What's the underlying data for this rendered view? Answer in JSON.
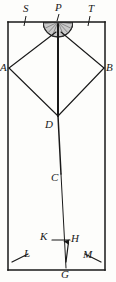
{
  "figure": {
    "kind": "geometry-diagram",
    "caption": "",
    "ink_color": "#191919",
    "background_color": "#fdfdfb",
    "hatch_color": "#8c8c8c",
    "frame": {
      "name": "outer-rectangle",
      "left": 8,
      "top": 22,
      "right": 105,
      "bottom": 270
    },
    "points": {
      "S": {
        "label": "S",
        "x": 22,
        "y": 22,
        "label_x": 24,
        "label_y": 5
      },
      "P": {
        "label": "P",
        "x": 58,
        "y": 22,
        "label_x": 57,
        "label_y": 4
      },
      "T": {
        "label": "T",
        "x": 92,
        "y": 22,
        "label_x": 90,
        "label_y": 5
      },
      "A": {
        "label": "A",
        "x": 9,
        "y": 68,
        "label_x": 1,
        "label_y": 62
      },
      "B": {
        "label": "B",
        "x": 104,
        "y": 68,
        "label_x": 106,
        "label_y": 62
      },
      "D": {
        "label": "D",
        "x": 58,
        "y": 116,
        "label_x": 46,
        "label_y": 116
      },
      "C": {
        "label": "C",
        "x": 61,
        "y": 174,
        "label_x": 53,
        "label_y": 172
      },
      "K": {
        "label": "K",
        "x": 52,
        "y": 240,
        "label_x": 41,
        "label_y": 234
      },
      "H": {
        "label": "H",
        "x": 69,
        "y": 240,
        "label_x": 72,
        "label_y": 235
      },
      "L": {
        "label": "L",
        "x": 22,
        "y": 258,
        "label_x": 25,
        "label_y": 250
      },
      "M": {
        "label": "M",
        "x": 88,
        "y": 258,
        "label_x": 85,
        "label_y": 251
      },
      "G": {
        "label": "G",
        "x": 66,
        "y": 270,
        "label_x": 62,
        "label_y": 270
      }
    },
    "semicircle": {
      "name": "hatched-semicircle-at-P",
      "center_x": 58,
      "center_y": 22,
      "radius": 15,
      "orientation": "below-line",
      "hatch": "radial-lines"
    },
    "segments": [
      {
        "name": "top-edge",
        "from": "frame-top-left",
        "to": "frame-top-right"
      },
      {
        "name": "left-edge",
        "from": "frame-top-left",
        "to": "frame-bottom-left"
      },
      {
        "name": "right-edge",
        "from": "frame-top-right",
        "to": "frame-bottom-right"
      },
      {
        "name": "bottom-edge",
        "from": "frame-bottom-left",
        "to": "frame-bottom-right"
      },
      {
        "name": "ray-P-to-A",
        "from": "P",
        "to": "A"
      },
      {
        "name": "ray-P-to-B",
        "from": "P",
        "to": "B"
      },
      {
        "name": "ray-A-to-D",
        "from": "A",
        "to": "D"
      },
      {
        "name": "ray-B-to-D",
        "from": "B",
        "to": "D"
      },
      {
        "name": "axis-P-to-D",
        "from": "P",
        "to": "D"
      },
      {
        "name": "axis-D-to-G",
        "from": "D",
        "to": "G"
      },
      {
        "name": "segment-K-to-H",
        "from": "K",
        "to": "H"
      },
      {
        "name": "arrow-G-to-H",
        "from": "G",
        "to": "H"
      },
      {
        "name": "tick-L",
        "from": "frame-bottom-left",
        "to": "L"
      },
      {
        "name": "tick-M",
        "from": "frame-bottom-right",
        "to": "M"
      },
      {
        "name": "tick-S",
        "from": "S-on-top-edge",
        "to": "S-label"
      },
      {
        "name": "tick-T",
        "from": "T-on-top-edge",
        "to": "T-label"
      },
      {
        "name": "tick-P",
        "from": "P-on-top-edge",
        "to": "P-label"
      }
    ]
  }
}
